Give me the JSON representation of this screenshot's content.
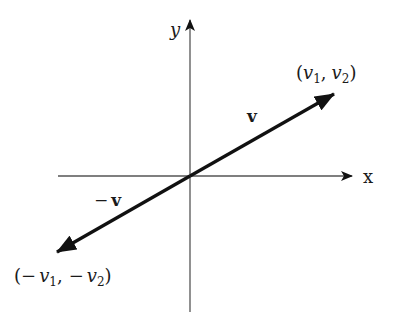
{
  "diagram": {
    "type": "vector-negation",
    "axes": {
      "x_label": "x",
      "y_label": "y"
    },
    "vectors": [
      {
        "name": "v",
        "label": "v",
        "tip_label": "(v1, v2)",
        "direction": "up-right"
      },
      {
        "name": "neg-v",
        "label": "−v",
        "tip_label": "(−v1, −v2)",
        "direction": "down-left"
      }
    ],
    "labels": {
      "v": "v",
      "neg_v_minus": "−",
      "neg_v": "v",
      "tip_open": "(",
      "tip_v": "v",
      "tip_sub1": "1",
      "tip_comma": ",",
      "tip_sub2": "2",
      "tip_close": ")",
      "neg_tip_open": "(",
      "neg_tip_minus1": "−",
      "neg_tip_minus2": "−",
      "neg_tip_close": ")"
    },
    "colors": {
      "axis": "#555555",
      "vector": "#111111"
    }
  }
}
